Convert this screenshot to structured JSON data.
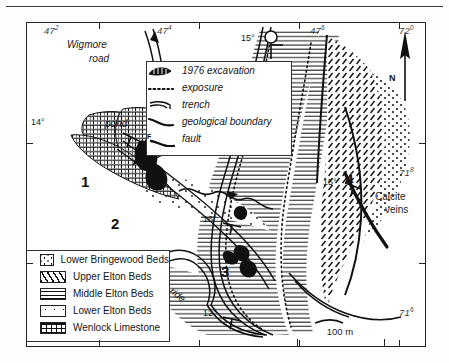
{
  "figure": {
    "type": "geological-map",
    "scale_bar": {
      "length_label": "100 m"
    },
    "north_arrow_label": "N"
  },
  "grid_labels": {
    "top": [
      {
        "text": "47",
        "sup": "2"
      },
      {
        "text": "47",
        "sup": "4"
      },
      {
        "text": "47",
        "sup": "6"
      },
      {
        "text": "72",
        "sup": "0"
      }
    ],
    "right": [
      {
        "text": "71",
        "sup": "8"
      },
      {
        "text": "71",
        "sup": "6"
      }
    ]
  },
  "map_labels": {
    "road": "Wigmore\nroad",
    "road_line1": "Wigmore",
    "road_line2": "road",
    "pond": "pond",
    "ride": "ride",
    "calcite_line1": "Calcite",
    "calcite_line2": "veins"
  },
  "dip_readings": [
    {
      "id": "dip-14",
      "value": "14°"
    },
    {
      "id": "dip-15-top",
      "value": "15°"
    },
    {
      "id": "dip-16",
      "value": "16°"
    },
    {
      "id": "dip-12",
      "value": "12°"
    },
    {
      "id": "dip-15-right",
      "value": "15°"
    }
  ],
  "locality_numbers": [
    "1",
    "2",
    "3",
    "4"
  ],
  "legend_symbols": {
    "items": [
      {
        "key": "excavation",
        "label": "1976 excavation"
      },
      {
        "key": "exposure",
        "label": "exposure"
      },
      {
        "key": "trench",
        "label": "trench"
      },
      {
        "key": "boundary",
        "label": "geological boundary"
      },
      {
        "key": "fault",
        "label": "fault",
        "marker": "F"
      }
    ]
  },
  "legend_strat": {
    "items": [
      {
        "key": "lower-bringewood",
        "label": "Lower Bringewood Beds",
        "pattern": "coarse-dots"
      },
      {
        "key": "upper-elton",
        "label": "Upper Elton Beds",
        "pattern": "diagonal-dashes"
      },
      {
        "key": "middle-elton",
        "label": "Middle Elton Beds",
        "pattern": "horizontal-lines"
      },
      {
        "key": "lower-elton",
        "label": "Lower Elton Beds",
        "pattern": "sparse-dots"
      },
      {
        "key": "wenlock-limestone",
        "label": "Wenlock Limestone",
        "pattern": "brick"
      }
    ]
  },
  "colors": {
    "ink": "#111111",
    "frame": "#222222",
    "paper": "#ffffff"
  }
}
